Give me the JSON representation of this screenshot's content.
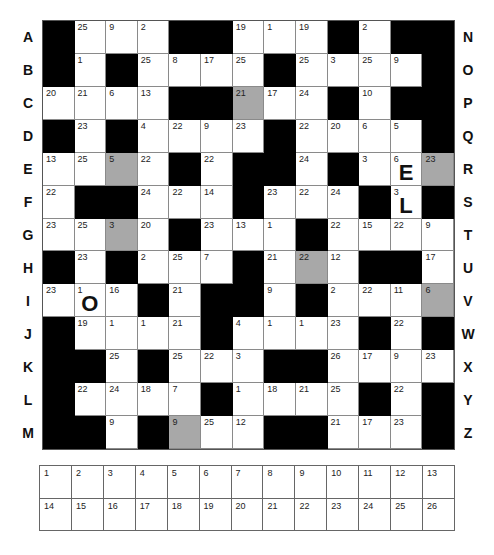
{
  "puzzle": {
    "type": "codeword",
    "rows": 13,
    "cols": 13,
    "colors": {
      "black": "#000000",
      "shaded": "#a8a8a8",
      "white": "#ffffff"
    },
    "left_labels": [
      "A",
      "B",
      "C",
      "D",
      "E",
      "F",
      "G",
      "H",
      "I",
      "J",
      "K",
      "L",
      "M"
    ],
    "right_labels": [
      "N",
      "O",
      "P",
      "Q",
      "R",
      "S",
      "T",
      "U",
      "V",
      "W",
      "X",
      "Y",
      "Z"
    ],
    "grid": [
      [
        "#",
        "25",
        "9",
        "2",
        "#",
        "#",
        "19",
        "1",
        "19",
        "#",
        "2",
        "#",
        "#"
      ],
      [
        "#",
        "1",
        "#",
        "25",
        "8",
        "17",
        "25",
        "#",
        "25",
        "3",
        "25",
        "9",
        "#"
      ],
      [
        "20",
        "21",
        "6",
        "13",
        "#",
        "#",
        "21g",
        "17",
        "24",
        "#",
        "10",
        "#",
        "#"
      ],
      [
        "#",
        "23",
        "#",
        "4",
        "22",
        "9",
        "23",
        "#",
        "22",
        "20",
        "6",
        "5",
        "#"
      ],
      [
        "13",
        "25",
        "5g",
        "22",
        "#",
        "22",
        "#",
        "#",
        "24",
        "#",
        "3",
        "6:E",
        "23g"
      ],
      [
        "22",
        "#",
        "#",
        "24",
        "22",
        "14",
        "#",
        "23",
        "22",
        "24",
        "#",
        "3:L",
        "#"
      ],
      [
        "23",
        "25",
        "3g",
        "20",
        "#",
        "23",
        "13",
        "1",
        "#",
        "22",
        "15",
        "22",
        "9"
      ],
      [
        "#",
        "23",
        "#",
        "2",
        "25",
        "7",
        "#",
        "21",
        "22g",
        "12",
        "#",
        "#",
        "17"
      ],
      [
        "23",
        "1:O",
        "16",
        "#",
        "21",
        "#",
        "#",
        "9",
        "#",
        "2",
        "22",
        "11",
        "6g"
      ],
      [
        "#",
        "19",
        "1",
        "1",
        "21",
        "#",
        "4",
        "1",
        "1",
        "23",
        "#",
        "22",
        "#"
      ],
      [
        "#",
        "#",
        "25",
        "#",
        "25",
        "22",
        "3",
        "#",
        "#",
        "26",
        "17",
        "9",
        "23"
      ],
      [
        "#",
        "22",
        "24",
        "18",
        "7",
        "#",
        "1",
        "18",
        "21",
        "25",
        "#",
        "22",
        "#"
      ],
      [
        "#",
        "#",
        "9",
        "#",
        "9g",
        "25",
        "12",
        "#",
        "#",
        "21",
        "17",
        "23",
        "#"
      ]
    ],
    "given_letters": [
      {
        "number": "6",
        "letter": "E"
      },
      {
        "number": "3",
        "letter": "L"
      },
      {
        "number": "1",
        "letter": "O"
      }
    ]
  },
  "answer_key": {
    "rows": [
      [
        "1",
        "2",
        "3",
        "4",
        "5",
        "6",
        "7",
        "8",
        "9",
        "10",
        "11",
        "12",
        "13"
      ],
      [
        "14",
        "15",
        "16",
        "17",
        "18",
        "19",
        "20",
        "21",
        "22",
        "23",
        "24",
        "25",
        "26"
      ]
    ]
  }
}
